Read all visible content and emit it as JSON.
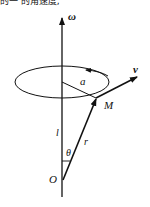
{
  "caption_fragment": "的一 的角速度,",
  "labels": {
    "omega": "ω",
    "v": "v",
    "a": "a",
    "M": "M",
    "l": "l",
    "theta": "θ",
    "r": "r",
    "O": "O"
  }
}
